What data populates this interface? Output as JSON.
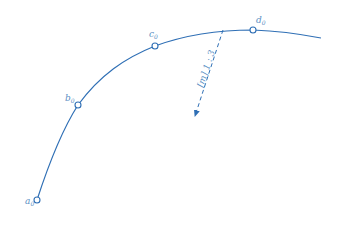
{
  "diagram": {
    "stroke_color": "#2f6fb5",
    "label_color": "#5b8fc4",
    "points": [
      {
        "id": "a0",
        "base": "a",
        "sub": "0",
        "x": 37,
        "y": 200
      },
      {
        "id": "b0",
        "base": "b",
        "sub": "0",
        "x": 78,
        "y": 105
      },
      {
        "id": "c0",
        "base": "c",
        "sub": "0",
        "x": 155,
        "y": 46
      },
      {
        "id": "d0",
        "base": "d",
        "sub": "0",
        "x": 253,
        "y": 30
      }
    ],
    "arrow": {
      "label": "[m] 1 : 3",
      "from": {
        "x": 223,
        "y": 30
      },
      "to": {
        "x": 195,
        "y": 117
      }
    }
  }
}
